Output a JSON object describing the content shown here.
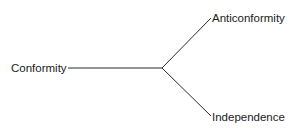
{
  "diagram": {
    "nodes": {
      "root": {
        "label": "Conformity"
      },
      "upper": {
        "label": "Anticonformity"
      },
      "lower": {
        "label": "Independence"
      }
    },
    "edges": [
      {
        "from": "Conformity",
        "to": "branch-point"
      },
      {
        "from": "branch-point",
        "to": "Anticonformity"
      },
      {
        "from": "branch-point",
        "to": "Independence"
      }
    ],
    "line_color": "#2a2a2a",
    "text_color": "#1a1a1a"
  }
}
